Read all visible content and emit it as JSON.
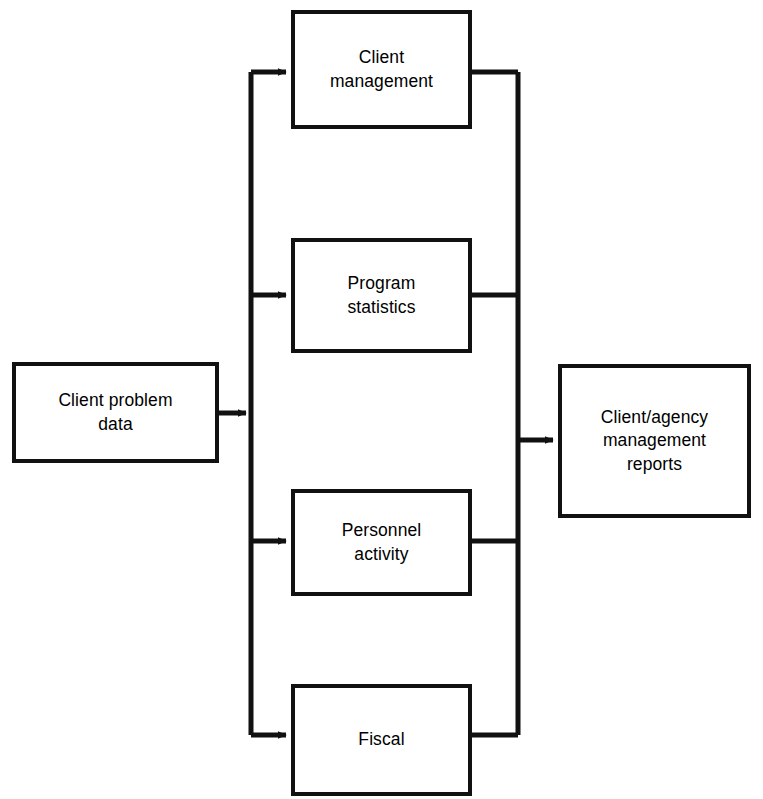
{
  "diagram": {
    "type": "flowchart",
    "orientation": "left-to-right",
    "stroke_color": "#111111",
    "background_color": "#ffffff",
    "nodes": [
      {
        "id": "client-problem-data",
        "label": "Client problem\ndata",
        "role": "input"
      },
      {
        "id": "client-management",
        "label": "Client\nmanagement",
        "role": "process"
      },
      {
        "id": "program-statistics",
        "label": "Program\nstatistics",
        "role": "process"
      },
      {
        "id": "personnel-activity",
        "label": "Personnel\nactivity",
        "role": "process"
      },
      {
        "id": "fiscal",
        "label": "Fiscal",
        "role": "process"
      },
      {
        "id": "client-agency-reports",
        "label": "Client/agency\nmanagement\nreports",
        "role": "output"
      }
    ],
    "edges": [
      {
        "from": "client-problem-data",
        "to": "client-management",
        "arrow": true
      },
      {
        "from": "client-problem-data",
        "to": "program-statistics",
        "arrow": true
      },
      {
        "from": "client-problem-data",
        "to": "personnel-activity",
        "arrow": true
      },
      {
        "from": "client-problem-data",
        "to": "fiscal",
        "arrow": true
      },
      {
        "from": "client-management",
        "to": "client-agency-reports",
        "arrow": true
      },
      {
        "from": "program-statistics",
        "to": "client-agency-reports",
        "arrow": true
      },
      {
        "from": "personnel-activity",
        "to": "client-agency-reports",
        "arrow": true
      },
      {
        "from": "fiscal",
        "to": "client-agency-reports",
        "arrow": true
      }
    ]
  }
}
